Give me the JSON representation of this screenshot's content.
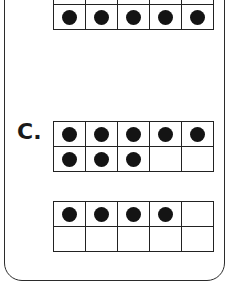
{
  "section_label": "C.",
  "frames": [
    {
      "id": "top-partial",
      "filled": [
        1,
        1,
        1,
        1,
        1,
        1,
        1,
        1,
        1,
        1
      ],
      "visible_rows": "bottom-only"
    },
    {
      "id": "c-frame-1",
      "filled": [
        1,
        1,
        1,
        1,
        1,
        1,
        1,
        1,
        0,
        0
      ]
    },
    {
      "id": "c-frame-2",
      "filled": [
        1,
        1,
        1,
        1,
        0,
        0,
        0,
        0,
        0,
        0
      ]
    }
  ],
  "colors": {
    "border": "#222222",
    "dot": "#141414",
    "background": "#ffffff"
  }
}
